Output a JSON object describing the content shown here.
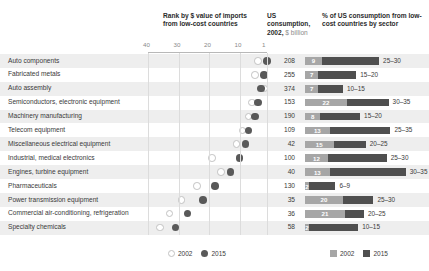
{
  "header": {
    "rank_title": "Rank by $ value of imports from low-cost countries",
    "consumption_title_bold": "US consumption,",
    "consumption_title_year": "2002,",
    "consumption_title_light": "$ billion",
    "pct_title": "% of US consumption from low-cost countries by sector"
  },
  "axis": {
    "ticks": [
      "40",
      "30",
      "20",
      "10",
      "1"
    ],
    "min": 1,
    "max": 40,
    "reversed": true
  },
  "legend": {
    "dots": [
      {
        "label": "2002",
        "style": "open-circle"
      },
      {
        "label": "2015",
        "style": "filled-circle"
      }
    ],
    "bars": [
      {
        "label": "2002",
        "color": "#a6a6a6"
      },
      {
        "label": "2015",
        "color": "#4f4f4f"
      }
    ]
  },
  "colors": {
    "dot_2002": "#ffffff",
    "dot_2015": "#595959",
    "bar_2002": "#a6a6a6",
    "bar_2015": "#4f4f4f",
    "row_alt": "#eeeeee",
    "grid": "#dcdcdc"
  },
  "chart_data": {
    "type": "bar",
    "title": "Rank by $ value of imports from low-cost countries",
    "xlabel": "Rank",
    "ylabel": "",
    "xlim": [
      40,
      1
    ],
    "grid": true,
    "legend_position": "bottom",
    "categories": [
      "Auto components",
      "Fabricated metals",
      "Auto assembly",
      "Semiconductors, electronic equipment",
      "Machinery manufacturing",
      "Telecom equipment",
      "Miscellaneous electrical equipment",
      "Industrial, medical electronics",
      "Engines, turbine equipment",
      "Pharmaceuticals",
      "Power transmission equipment",
      "Commercial air-conditioning, refrigeration",
      "Specialty chemicals"
    ],
    "series": [
      {
        "name": "Rank 2002",
        "values": [
          4,
          5,
          2,
          6,
          7,
          9,
          11,
          19,
          16,
          24,
          29,
          33,
          36
        ]
      },
      {
        "name": "Rank 2015",
        "values": [
          1,
          2,
          3,
          4,
          5,
          7,
          8,
          10,
          13,
          18,
          22,
          27,
          31
        ]
      },
      {
        "name": "% 2002",
        "values": [
          9,
          7,
          7,
          22,
          8,
          13,
          15,
          12,
          13,
          2,
          20,
          21,
          2
        ]
      }
    ],
    "rows": [
      {
        "sector": "Auto components",
        "rank_2002": 4,
        "rank_2015": 1,
        "consumption_2002": "208",
        "pct_2002": 9,
        "pct_2015_range": "25–30",
        "pct_2015_width": 30
      },
      {
        "sector": "Fabricated metals",
        "rank_2002": 5,
        "rank_2015": 2,
        "consumption_2002": "255",
        "pct_2002": 7,
        "pct_2015_range": "15–20",
        "pct_2015_width": 20
      },
      {
        "sector": "Auto assembly",
        "rank_2002": 2,
        "rank_2015": 3,
        "consumption_2002": "374",
        "pct_2002": 7,
        "pct_2015_range": "10–15",
        "pct_2015_width": 13
      },
      {
        "sector": "Semiconductors, electronic equipment",
        "rank_2002": 6,
        "rank_2015": 4,
        "consumption_2002": "153",
        "pct_2002": 22,
        "pct_2015_range": "30–35",
        "pct_2015_width": 22
      },
      {
        "sector": "Machinery manufacturing",
        "rank_2002": 7,
        "rank_2015": 5,
        "consumption_2002": "190",
        "pct_2002": 8,
        "pct_2015_range": "15–20",
        "pct_2015_width": 21
      },
      {
        "sector": "Telecom equipment",
        "rank_2002": 9,
        "rank_2015": 7,
        "consumption_2002": "109",
        "pct_2002": 13,
        "pct_2015_range": "25–35",
        "pct_2015_width": 32
      },
      {
        "sector": "Miscellaneous electrical equipment",
        "rank_2002": 11,
        "rank_2015": 8,
        "consumption_2002": "42",
        "pct_2002": 15,
        "pct_2015_range": "20–25",
        "pct_2015_width": 17
      },
      {
        "sector": "Industrial, medical electronics",
        "rank_2002": 19,
        "rank_2015": 10,
        "consumption_2002": "100",
        "pct_2002": 12,
        "pct_2015_range": "25–30",
        "pct_2015_width": 31
      },
      {
        "sector": "Engines, turbine equipment",
        "rank_2002": 16,
        "rank_2015": 13,
        "consumption_2002": "40",
        "pct_2002": 13,
        "pct_2015_range": "30–35",
        "pct_2015_width": 40
      },
      {
        "sector": "Pharmaceuticals",
        "rank_2002": 24,
        "rank_2015": 18,
        "consumption_2002": "130",
        "pct_2002": 2,
        "pct_2015_range": "6–9",
        "pct_2015_width": 14
      },
      {
        "sector": "Power transmission equipment",
        "rank_2002": 29,
        "rank_2015": 22,
        "consumption_2002": "35",
        "pct_2002": 20,
        "pct_2015_range": "25–30",
        "pct_2015_width": 16
      },
      {
        "sector": "Commercial air-conditioning, refrigeration",
        "rank_2002": 33,
        "rank_2015": 27,
        "consumption_2002": "36",
        "pct_2002": 21,
        "pct_2015_range": "20–25",
        "pct_2015_width": 10
      },
      {
        "sector": "Specialty chemicals",
        "rank_2002": 36,
        "rank_2015": 31,
        "consumption_2002": "58",
        "pct_2002": 2,
        "pct_2015_range": "10–15",
        "pct_2015_width": 26
      }
    ]
  }
}
